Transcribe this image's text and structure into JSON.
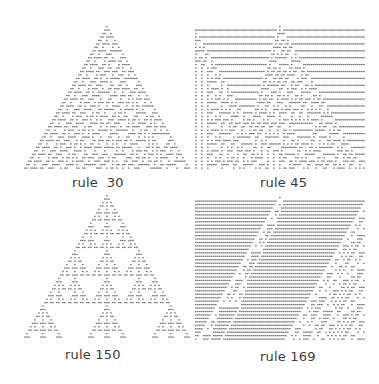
{
  "figure": {
    "ink_color": "#4a4a4a",
    "background_color": "#ffffff",
    "panels": [
      {
        "id": "rule30",
        "label": "rule  30",
        "rule": 30,
        "steps": 42,
        "initial": "single-cell"
      },
      {
        "id": "rule45",
        "label": "rule 45",
        "rule": 45,
        "steps": 42,
        "initial": "single-cell"
      },
      {
        "id": "rule150",
        "label": "rule 150",
        "rule": 150,
        "steps": 42,
        "initial": "single-cell"
      },
      {
        "id": "rule169",
        "label": "rule 169",
        "rule": 169,
        "steps": 42,
        "initial": "single-cell"
      }
    ]
  }
}
